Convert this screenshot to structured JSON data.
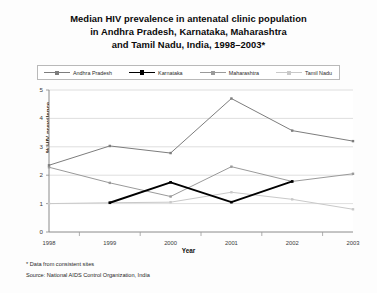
{
  "title": {
    "line1": "Median HIV prevalence in antenatal clinic population",
    "line2": "in Andhra Pradesh, Karnataka, Maharashtra",
    "line3": "and Tamil Nadu, India, 1998–2003*"
  },
  "legend": [
    {
      "label": "Andhra Pradesh",
      "color": "#7d7d7d",
      "marker": "square",
      "bold": false
    },
    {
      "label": "Karnataka",
      "color": "#000000",
      "marker": "square",
      "bold": true
    },
    {
      "label": "Maharashtra",
      "color": "#9a9a9a",
      "marker": "square",
      "bold": false
    },
    {
      "label": "Tamil Nadu",
      "color": "#c9c9c9",
      "marker": "square",
      "bold": false
    }
  ],
  "axes": {
    "ylabel": "% HIV prevalence",
    "xlabel": "Year",
    "yticks": [
      "0",
      "1",
      "2",
      "3",
      "4",
      "5"
    ],
    "xticks": [
      "1998",
      "1999",
      "2000",
      "2001",
      "2002",
      "2003"
    ]
  },
  "footnotes": {
    "note": "* Data from consistent sites",
    "source": "Source: National AIDS Control Organization, India"
  },
  "chart_data": {
    "type": "line",
    "title": "Median HIV prevalence in antenatal clinic population in Andhra Pradesh, Karnataka, Maharashtra and Tamil Nadu, India, 1998–2003*",
    "xlabel": "Year",
    "ylabel": "% HIV prevalence",
    "categories": [
      "1998",
      "1999",
      "2000",
      "2001",
      "2002",
      "2003"
    ],
    "ylim": [
      0,
      5
    ],
    "ytick_step": 1,
    "grid": "horizontal",
    "legend_position": "top",
    "series": [
      {
        "name": "Andhra Pradesh",
        "color": "#7d7d7d",
        "values": [
          2.35,
          3.03,
          2.78,
          4.7,
          3.57,
          3.2
        ]
      },
      {
        "name": "Karnataka",
        "color": "#000000",
        "values": [
          null,
          1.03,
          1.75,
          1.05,
          1.78,
          null
        ]
      },
      {
        "name": "Maharashtra",
        "color": "#9a9a9a",
        "values": [
          2.28,
          1.73,
          1.25,
          2.3,
          1.78,
          2.05
        ]
      },
      {
        "name": "Tamil Nadu",
        "color": "#c9c9c9",
        "values": [
          1.0,
          1.03,
          1.05,
          1.4,
          1.15,
          0.8
        ]
      }
    ]
  }
}
